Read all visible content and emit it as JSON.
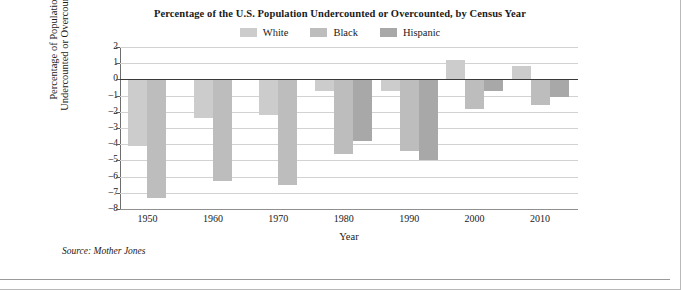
{
  "chart_data": {
    "type": "bar",
    "title": "Percentage of the U.S. Population Undercounted or Overcounted, by Census Year",
    "xlabel": "Year",
    "ylabel_line1": "Percentage of Population",
    "ylabel_line2": "Undercounted or Overcounted",
    "categories": [
      "1950",
      "1960",
      "1970",
      "1980",
      "1990",
      "2000",
      "2010"
    ],
    "ylim": [
      -8,
      2
    ],
    "yticks": [
      "2",
      "1",
      "0",
      "-1",
      "-2",
      "-3",
      "-4",
      "-5",
      "-6",
      "-7",
      "-8"
    ],
    "grid": true,
    "legend_position": "top-center",
    "series": [
      {
        "name": "White",
        "color": "#cccccc",
        "values": [
          -4.1,
          -2.4,
          -2.2,
          -0.7,
          -0.7,
          1.2,
          0.8
        ]
      },
      {
        "name": "Black",
        "color": "#bdbdbd",
        "values": [
          -7.3,
          -6.3,
          -6.5,
          -4.6,
          -4.4,
          -1.8,
          -1.6
        ]
      },
      {
        "name": "Hispanic",
        "color": "#a8a8a8",
        "values": [
          null,
          null,
          null,
          -3.8,
          -5.0,
          -0.7,
          -1.1
        ]
      }
    ],
    "source": "Source: Mother Jones"
  }
}
